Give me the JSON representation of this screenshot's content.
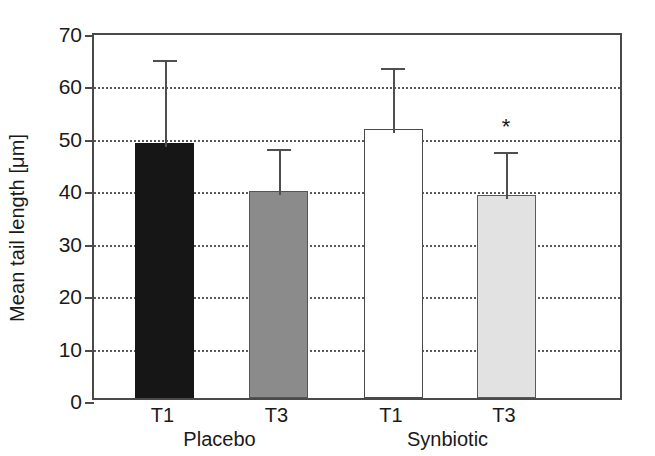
{
  "chart_data": {
    "type": "bar",
    "title": "",
    "xlabel": "",
    "ylabel": "Mean tail length [μm]",
    "ylim": [
      0,
      70
    ],
    "yticks": [
      0,
      10,
      20,
      30,
      40,
      50,
      60,
      70
    ],
    "ytick_labels": [
      "0",
      "10",
      "20",
      "30",
      "40",
      "50",
      "60",
      "70"
    ],
    "grid": true,
    "grid_axis": "y",
    "grid_style": "dotted",
    "legend": "none",
    "categories": [
      "T1",
      "T3",
      "T1",
      "T3"
    ],
    "groups": [
      {
        "label": "Placebo",
        "categories": [
          "T1",
          "T3"
        ]
      },
      {
        "label": "Synbiotic",
        "categories": [
          "T1",
          "T3"
        ]
      }
    ],
    "values": [
      48.6,
      39.5,
      51.3,
      38.7
    ],
    "errors_upper": [
      16.6,
      8.8,
      12.4,
      9.0
    ],
    "error_tops": [
      65.2,
      48.3,
      63.7,
      47.7
    ],
    "bar_fills": [
      "#161616",
      "#8b8b8b",
      "#ffffff",
      "#e2e2e2"
    ],
    "bar_fill_names": [
      "black",
      "gray",
      "white",
      "light-gray"
    ],
    "annotations": [
      {
        "text": "*",
        "series_index": 3,
        "value": 52.5,
        "meaning": "significant"
      }
    ]
  },
  "axis": {
    "y_title": "Mean tail length [μm]",
    "tick_labels": [
      "70",
      "60",
      "50",
      "40",
      "30",
      "20",
      "10",
      "0"
    ]
  },
  "bars": [
    {
      "name": "placebo-t1",
      "label": "T1",
      "value": 48.6,
      "error_top": 65.2,
      "fill": "#161616"
    },
    {
      "name": "placebo-t3",
      "label": "T3",
      "value": 39.5,
      "error_top": 48.3,
      "fill": "#8b8b8b"
    },
    {
      "name": "synbiotic-t1",
      "label": "T1",
      "value": 51.3,
      "error_top": 63.7,
      "fill": "#ffffff"
    },
    {
      "name": "synbiotic-t3",
      "label": "T3",
      "value": 38.7,
      "error_top": 47.7,
      "fill": "#e2e2e2"
    }
  ],
  "groups": [
    {
      "name": "placebo",
      "label": "Placebo"
    },
    {
      "name": "synbiotic",
      "label": "Synbiotic"
    }
  ],
  "marker": {
    "symbol": "*"
  }
}
